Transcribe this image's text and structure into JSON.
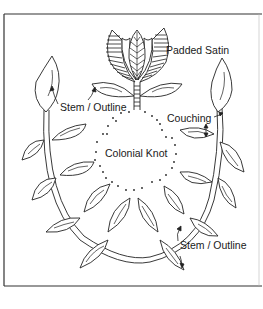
{
  "diagram": {
    "type": "embroidery stitch guide",
    "labels": {
      "padded_satin": "Padded Satin",
      "stem_outline_top": "Stem / Outline",
      "couching": "Couching",
      "colonial_knot": "Colonial Knot",
      "stem_outline_bottom": "Stem / Outline"
    },
    "colors": {
      "line": "#222222",
      "background": "#ffffff",
      "frame": "#333333"
    }
  }
}
